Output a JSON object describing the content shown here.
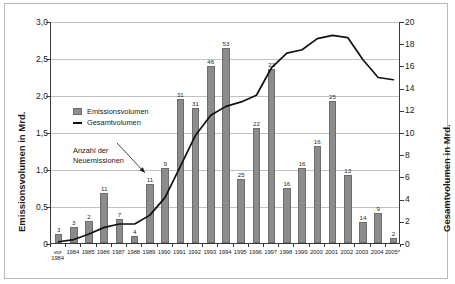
{
  "chart_data": {
    "type": "bar",
    "title": "",
    "xlabel": "",
    "ylabel": "Emissionsvolumen in Mrd.",
    "y2label": "Gesamtvolumen in Mrd.",
    "ylim": [
      0,
      3.0
    ],
    "y2lim": [
      0,
      20
    ],
    "grid": true,
    "legend_position": "inside-upper-left",
    "categories": [
      "vor 1984",
      "1984",
      "1985",
      "1986",
      "1987",
      "1988",
      "1989",
      "1990",
      "1991",
      "1992",
      "1993",
      "1994",
      "1995",
      "1996",
      "1997",
      "1998",
      "1999",
      "2000",
      "2001",
      "2002",
      "2003",
      "2004",
      "2005*"
    ],
    "series": [
      {
        "name": "Emissionsvolumen",
        "type": "bar",
        "axis": "left",
        "unit": "Mrd.",
        "values": [
          0.12,
          0.21,
          0.3,
          0.68,
          0.33,
          0.1,
          0.8,
          1.01,
          1.95,
          1.82,
          2.39,
          2.63,
          0.87,
          1.55,
          2.35,
          0.74,
          1.01,
          1.31,
          1.92,
          0.92,
          0.28,
          0.4,
          0.07
        ],
        "point_labels": [
          "3",
          "3",
          "2",
          "11",
          "7",
          "4",
          "11",
          "9",
          "31",
          "31",
          "46",
          "53",
          "25",
          "22",
          "23",
          "16",
          "16",
          "16",
          "25",
          "13",
          "14",
          "9",
          "2"
        ]
      },
      {
        "name": "Gesamtvolumen",
        "type": "line",
        "axis": "right",
        "unit": "Mrd.",
        "values": [
          0.2,
          0.4,
          0.9,
          1.5,
          1.8,
          1.8,
          2.6,
          4.2,
          7.0,
          9.8,
          11.6,
          12.4,
          12.8,
          13.4,
          15.9,
          17.2,
          17.5,
          18.5,
          18.8,
          18.6,
          16.6,
          15.0,
          14.8
        ]
      }
    ],
    "yticks_left": [
      "0",
      "0,5",
      "1,0",
      "1,5",
      "2,0",
      "2,5",
      "3,0"
    ],
    "yticks_right": [
      "0",
      "2",
      "4",
      "6",
      "8",
      "10",
      "12",
      "14",
      "16",
      "18",
      "20"
    ],
    "annotations": [
      {
        "text_line1": "Anzahl der",
        "text_line2": "Neuemissionen",
        "points_at": "1989"
      }
    ],
    "colors": {
      "bar_fill": "#8c8c8c",
      "bar_stroke": "#6d6d6d",
      "line": "#111111",
      "grid": "#c2c2c2",
      "axis": "#3a3a3a",
      "frame": "#b9b9b9"
    }
  },
  "category_label_lines": {
    "vor 1984": [
      "vor",
      "1984"
    ]
  }
}
